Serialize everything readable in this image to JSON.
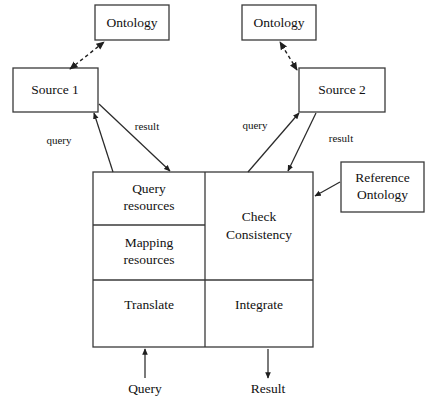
{
  "diagram": {
    "colors": {
      "stroke": "#3a3a3a",
      "arrow": "#2a2a2a",
      "text": "#111111",
      "background": "#ffffff"
    },
    "boxes": {
      "ontology_left": {
        "label": "Ontology"
      },
      "ontology_right": {
        "label": "Ontology"
      },
      "source_1": {
        "label": "Source 1"
      },
      "source_2": {
        "label": "Source 2"
      },
      "reference_ontology": {
        "label_line1": "Reference",
        "label_line2": "Ontology"
      }
    },
    "mediator": {
      "cells": {
        "query_resources": {
          "line1": "Query",
          "line2": "resources"
        },
        "mapping_resources": {
          "line1": "Mapping",
          "line2": "resources"
        },
        "translate": {
          "label": "Translate"
        },
        "check_consistency": {
          "line1": "Check",
          "line2": "Consistency"
        },
        "integrate": {
          "label": "Integrate"
        }
      }
    },
    "edge_labels": {
      "query_left": "query",
      "result_left": "result",
      "query_right": "query",
      "result_right": "result"
    },
    "io_labels": {
      "query_in": "Query",
      "result_out": "Result"
    },
    "icons": {
      "arrowhead": "solid-triangle-arrowhead",
      "dashed_link": "dashed-double-arrow"
    }
  }
}
